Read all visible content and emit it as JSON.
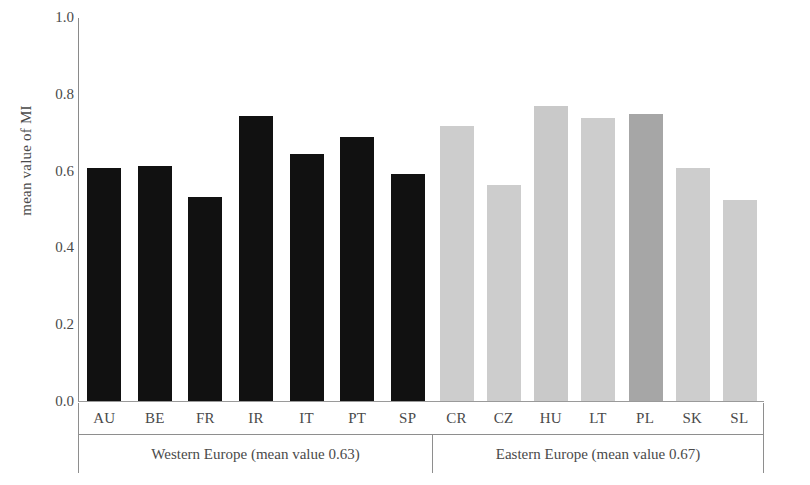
{
  "chart_data": {
    "type": "bar",
    "title": "",
    "xlabel": "",
    "ylabel": "mean value of MI",
    "ylim": [
      0.0,
      1.0
    ],
    "grid": false,
    "legend": "none",
    "y_ticks": [
      "1.0",
      "0.8",
      "0.6",
      "0.4",
      "0.2",
      "0.0"
    ],
    "categories": [
      "AU",
      "BE",
      "FR",
      "IR",
      "IT",
      "PT",
      "SP",
      "CR",
      "CZ",
      "HU",
      "LT",
      "PL",
      "SK",
      "SL"
    ],
    "values": [
      0.61,
      0.615,
      0.535,
      0.745,
      0.645,
      0.69,
      0.595,
      0.72,
      0.565,
      0.77,
      0.74,
      0.75,
      0.61,
      0.525
    ],
    "groups": [
      {
        "name": "Western Europe",
        "label": "Western Europe (mean value 0.63)",
        "mean_value": 0.63,
        "color": "#111111",
        "bars": [
          {
            "category": "AU",
            "value": 0.61,
            "color": "#111111"
          },
          {
            "category": "BE",
            "value": 0.615,
            "color": "#111111"
          },
          {
            "category": "FR",
            "value": 0.535,
            "color": "#111111"
          },
          {
            "category": "IR",
            "value": 0.745,
            "color": "#111111"
          },
          {
            "category": "IT",
            "value": 0.645,
            "color": "#111111"
          },
          {
            "category": "PT",
            "value": 0.69,
            "color": "#111111"
          },
          {
            "category": "SP",
            "value": 0.595,
            "color": "#111111"
          }
        ]
      },
      {
        "name": "Eastern Europe",
        "label": "Eastern Europe (mean value 0.67)",
        "mean_value": 0.67,
        "color": "#cdcdcd",
        "bars": [
          {
            "category": "CR",
            "value": 0.72,
            "color": "#cdcdcd"
          },
          {
            "category": "CZ",
            "value": 0.565,
            "color": "#cdcdcd"
          },
          {
            "category": "HU",
            "value": 0.77,
            "color": "#c9c9c9"
          },
          {
            "category": "LT",
            "value": 0.74,
            "color": "#cdcdcd"
          },
          {
            "category": "PL",
            "value": 0.75,
            "color": "#a6a6a6"
          },
          {
            "category": "SK",
            "value": 0.61,
            "color": "#cdcdcd"
          },
          {
            "category": "SL",
            "value": 0.525,
            "color": "#cdcdcd"
          }
        ]
      }
    ]
  },
  "axis": {
    "y_title": "mean value of MI"
  }
}
